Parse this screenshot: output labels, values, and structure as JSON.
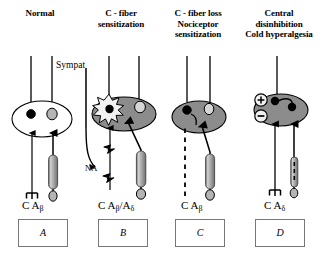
{
  "figure": {
    "type": "schematic-diagram",
    "panel_count": 4
  },
  "panels": [
    {
      "id": "A",
      "letter": "A",
      "title_lines": [
        "Normal"
      ],
      "fiber_labels": [
        "C",
        "A",
        "β"
      ],
      "fiber_label_text": "C  Aβ",
      "cell_body_fill": "white",
      "neurons": [
        {
          "name": "c-fiber-soma",
          "fill": "black"
        },
        {
          "name": "a-beta-soma",
          "fill": "gray"
        }
      ],
      "features": [
        "free-nerve-ending",
        "myelin-sheath",
        "end-organ"
      ]
    },
    {
      "id": "B",
      "letter": "B",
      "title_lines": [
        "C - fiber",
        "sensitization"
      ],
      "fiber_labels": [
        "C",
        "A",
        "β",
        "/",
        "A",
        "δ"
      ],
      "fiber_label_text": "C  Aβ/Aδ",
      "cell_body_fill": "gray",
      "annotations": [
        {
          "name": "sympathetic-label",
          "text": "Sympat"
        },
        {
          "name": "noradrenaline-label",
          "text": "NA"
        }
      ],
      "features": [
        "ectopic-discharge-burst",
        "sympathetic-sprouting",
        "axonal-spark"
      ]
    },
    {
      "id": "C",
      "letter": "C",
      "title_lines": [
        "C - fiber loss",
        "Nociceptor",
        "sensitization"
      ],
      "fiber_labels": [
        "C",
        "A",
        "β"
      ],
      "fiber_label_text": "C  Aβ",
      "cell_body_fill": "gray",
      "features": [
        "degenerated-c-fiber-dashed",
        "sprouting-arrow",
        "myelin-sheath"
      ]
    },
    {
      "id": "D",
      "letter": "D",
      "title_lines": [
        "Central",
        "disinhibition",
        "Cold hyperalgesia"
      ],
      "fiber_labels": [
        "C",
        "A",
        "δ"
      ],
      "fiber_label_text": "C  Aδ",
      "cell_body_fill": "gray",
      "signs": [
        {
          "name": "excitation-sign",
          "symbol": "+"
        },
        {
          "name": "inhibition-sign",
          "symbol": "−"
        }
      ],
      "features": [
        "free-nerve-ending",
        "cold-receptor",
        "central-connections"
      ]
    }
  ],
  "colors": {
    "ink": "#000000",
    "soma_gray": "#9a9a9a",
    "ganglion_gray": "#8c8c8c",
    "box_border": "#777777",
    "background": "#ffffff"
  }
}
